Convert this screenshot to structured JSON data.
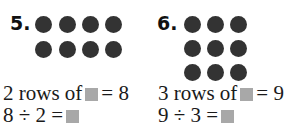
{
  "problems": [
    {
      "number": "5.",
      "dots": {
        "rows": 2,
        "cols": 4
      },
      "line1": {
        "pre": "2 rows of",
        "post": "= 8"
      },
      "line2": {
        "pre": "8 ÷ 2 =",
        "post": ""
      }
    },
    {
      "number": "6.",
      "dots": {
        "rows": 3,
        "cols": 3
      },
      "line1": {
        "pre": "3 rows of",
        "post": "= 9"
      },
      "line2": {
        "pre": "9 ÷ 3 =",
        "post": ""
      }
    }
  ],
  "colors": {
    "dot": "#333333",
    "blank_box": "#a8a8a8"
  }
}
